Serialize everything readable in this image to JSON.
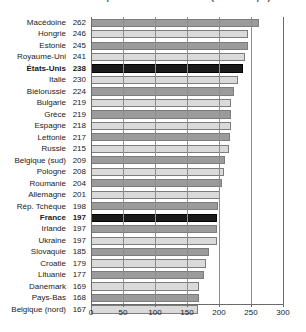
{
  "figure": {
    "title_clipped": "Taux de détention pour 100 000 habitants (chiffre clipé)",
    "footnote_clipped": ""
  },
  "axis": {
    "ticks": [
      0,
      50,
      100,
      150,
      200,
      250,
      300
    ],
    "tick_labels": [
      "0",
      "50",
      "100",
      "150",
      "200",
      "250",
      "300"
    ],
    "min": 0,
    "max": 300
  },
  "colors": {
    "bar_dark": "#9b9b9b",
    "bar_light": "#dadada",
    "bar_highlight": "#1a1a1a",
    "bar_outline": "#7c7c7c",
    "axis": "#6b6b6b",
    "grid": "#8d8d8d",
    "text": "#1a1a1a",
    "background": "#ffffff"
  },
  "chart_data": {
    "type": "bar",
    "orientation": "horizontal",
    "title": "",
    "xlabel": "",
    "ylabel": "",
    "xlim": [
      0,
      300
    ],
    "grid": true,
    "legend": "none",
    "categories": [
      "Macédoine",
      "Hongrie",
      "Estonie",
      "Royaume-Uni",
      "États-Unis",
      "Italie",
      "Biélorussie",
      "Bulgarie",
      "Grèce",
      "Espagne",
      "Lettonie",
      "Russie",
      "Belgique (sud)",
      "Pologne",
      "Roumanie",
      "Allemagne",
      "Rép. Tchèque",
      "France",
      "Irlande",
      "Ukraine",
      "Slovaquie",
      "Croatie",
      "Lituanie",
      "Danemark",
      "Pays-Bas",
      "Belgique (nord)"
    ],
    "values": [
      262,
      246,
      245,
      241,
      238,
      230,
      224,
      219,
      219,
      218,
      217,
      215,
      209,
      208,
      204,
      201,
      198,
      197,
      197,
      197,
      185,
      179,
      177,
      169,
      168,
      167
    ],
    "highlighted": [
      "États-Unis",
      "France"
    ],
    "styles": [
      "dark",
      "light",
      "dark",
      "light",
      "black",
      "light",
      "dark",
      "light",
      "dark",
      "light",
      "dark",
      "light",
      "dark",
      "light",
      "dark",
      "light",
      "dark",
      "black",
      "dark",
      "light",
      "dark",
      "light",
      "dark",
      "light",
      "dark",
      "light"
    ]
  }
}
